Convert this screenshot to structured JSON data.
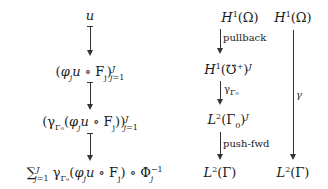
{
  "diagram": {
    "left_column": {
      "nodes": [
        {
          "id": "u",
          "text": "u"
        },
        {
          "id": "local",
          "text": "(φⱼu ∘ Fⱼ)",
          "sup": "J",
          "sub": "j=1"
        },
        {
          "id": "trace_local",
          "text": "(γΓ₀(φⱼu ∘ Fⱼ))",
          "sup": "J",
          "sub": "j=1"
        },
        {
          "id": "sum",
          "text": "∑",
          "sum_sup": "J",
          "sum_sub": "j=1",
          "body": " γΓ₀(φⱼu ∘ Fⱼ) ∘ Φ",
          "phi_sup": "−1",
          "phi_sub": "j"
        }
      ],
      "arrow_type": "mapsto"
    },
    "middle_column": {
      "nodes": [
        {
          "id": "H1_Omega",
          "text": "H¹(Ω)"
        },
        {
          "id": "H1_Uplus_J",
          "text": "H¹(℧⁺)ᴶ"
        },
        {
          "id": "L2_Gamma0_J",
          "text": "L²(Γ₀)ᴶ"
        },
        {
          "id": "L2_Gamma",
          "text": "L²(Γ)"
        }
      ],
      "arrows": [
        {
          "from": "H1_Omega",
          "to": "H1_Uplus_J",
          "label": "pullback"
        },
        {
          "from": "H1_Uplus_J",
          "to": "L2_Gamma0_J",
          "label": "γΓ₀"
        },
        {
          "from": "L2_Gamma0_J",
          "to": "L2_Gamma",
          "label": "push-fwd"
        }
      ]
    },
    "right_column": {
      "nodes": [
        {
          "id": "H1_Omega_r",
          "text": "H¹(Ω)"
        },
        {
          "id": "L2_Gamma_r",
          "text": "L²(Γ)"
        }
      ],
      "arrows": [
        {
          "from": "H1_Omega_r",
          "to": "L2_Gamma_r",
          "label": "γ"
        }
      ]
    }
  }
}
